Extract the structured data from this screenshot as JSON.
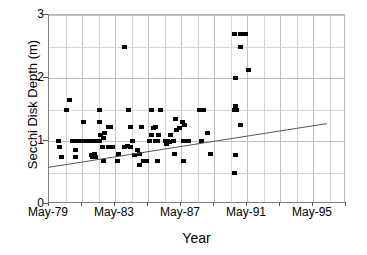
{
  "chart_data": {
    "type": "scatter",
    "title": "",
    "xlabel": "Year",
    "ylabel": "Secchi Disk Depth (m)",
    "xlim": [
      0,
      18
    ],
    "ylim": [
      0,
      3
    ],
    "x_tick_labels": [
      "May-79",
      "May-83",
      "May-87",
      "May-91",
      "May-95"
    ],
    "x_tick_values": [
      0,
      4,
      8,
      12,
      16
    ],
    "y_tick_labels": [
      "0",
      "1",
      "2",
      "3"
    ],
    "y_tick_values": [
      0,
      1,
      2,
      3
    ],
    "y_minor_ticks": [
      0.5,
      1.5,
      2.5
    ],
    "grid": "major vertical and horizontal, minor horizontal",
    "legend": "none",
    "marker": "filled black square",
    "series": [
      {
        "name": "Secchi disk depth observations",
        "points": [
          [
            0.55,
            1.0
          ],
          [
            0.62,
            0.9
          ],
          [
            0.7,
            0.75
          ],
          [
            1.05,
            1.5
          ],
          [
            1.22,
            1.65
          ],
          [
            1.4,
            1.0
          ],
          [
            1.55,
            1.0
          ],
          [
            1.7,
            1.0
          ],
          [
            1.85,
            1.0
          ],
          [
            1.95,
            1.0
          ],
          [
            2.05,
            1.0
          ],
          [
            2.15,
            1.0
          ],
          [
            2.25,
            1.0
          ],
          [
            2.35,
            1.0
          ],
          [
            2.45,
            1.0
          ],
          [
            2.55,
            1.0
          ],
          [
            2.65,
            1.0
          ],
          [
            2.78,
            1.0
          ],
          [
            2.9,
            1.0
          ],
          [
            3.02,
            1.0
          ],
          [
            1.55,
            0.85
          ],
          [
            1.58,
            0.75
          ],
          [
            2.05,
            1.3
          ],
          [
            2.55,
            0.78
          ],
          [
            2.62,
            0.75
          ],
          [
            2.7,
            0.8
          ],
          [
            2.78,
            0.75
          ],
          [
            3.05,
            1.5
          ],
          [
            3.02,
            1.3
          ],
          [
            3.08,
            1.1
          ],
          [
            3.18,
            0.9
          ],
          [
            3.26,
            1.05
          ],
          [
            3.34,
            1.12
          ],
          [
            3.3,
            0.68
          ],
          [
            3.55,
            1.22
          ],
          [
            3.7,
            1.22
          ],
          [
            3.6,
            0.9
          ],
          [
            3.8,
            0.9
          ],
          [
            4.15,
            0.8
          ],
          [
            4.1,
            0.68
          ],
          [
            4.8,
            1.5
          ],
          [
            4.9,
            1.22
          ],
          [
            4.55,
            0.9
          ],
          [
            4.72,
            0.92
          ],
          [
            4.9,
            0.9
          ],
          [
            5.0,
            1.0
          ],
          [
            5.15,
            0.78
          ],
          [
            5.3,
            0.85
          ],
          [
            5.45,
            0.8
          ],
          [
            5.55,
            1.22
          ],
          [
            5.45,
            0.62
          ],
          [
            5.7,
            0.68
          ],
          [
            5.85,
            0.68
          ],
          [
            6.05,
            1.0
          ],
          [
            6.2,
            1.1
          ],
          [
            6.3,
            1.2
          ],
          [
            6.15,
            1.5
          ],
          [
            6.45,
            1.22
          ],
          [
            6.4,
            1.0
          ],
          [
            6.55,
            1.0
          ],
          [
            6.7,
            1.5
          ],
          [
            6.62,
            1.1
          ],
          [
            6.55,
            0.68
          ],
          [
            7.0,
            1.0
          ],
          [
            7.15,
            1.0
          ],
          [
            7.3,
            1.1
          ],
          [
            7.1,
            0.95
          ],
          [
            7.25,
            0.98
          ],
          [
            7.5,
            1.0
          ],
          [
            7.62,
            1.35
          ],
          [
            7.7,
            1.18
          ],
          [
            7.85,
            1.2
          ],
          [
            7.6,
            0.8
          ],
          [
            8.05,
            1.3
          ],
          [
            8.2,
            1.25
          ],
          [
            8.1,
            1.0
          ],
          [
            8.25,
            1.0
          ],
          [
            8.4,
            1.0
          ],
          [
            8.1,
            0.68
          ],
          [
            9.1,
            1.5
          ],
          [
            9.3,
            1.5
          ],
          [
            9.2,
            1.0
          ],
          [
            9.55,
            1.12
          ],
          [
            9.75,
            0.8
          ],
          [
            4.55,
            2.5
          ],
          [
            11.2,
            1.5
          ],
          [
            11.35,
            1.5
          ],
          [
            11.55,
            1.25
          ],
          [
            11.3,
            2.0
          ],
          [
            11.2,
            2.7
          ],
          [
            11.55,
            2.7
          ],
          [
            11.72,
            2.7
          ],
          [
            11.9,
            2.7
          ],
          [
            11.6,
            2.5
          ],
          [
            12.05,
            2.12
          ],
          [
            11.25,
            1.55
          ],
          [
            11.3,
            0.78
          ],
          [
            11.18,
            0.5
          ]
        ]
      }
    ],
    "trendline": {
      "type": "linear-fit",
      "x_start": 0,
      "y_start": 0.565,
      "x_end": 16.9,
      "y_end": 1.26
    }
  }
}
